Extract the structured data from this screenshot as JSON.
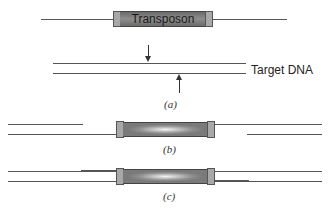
{
  "panel_a": {
    "transposon_label": "Transposon",
    "target_label": "Target DNA",
    "caption": "(a)"
  },
  "panel_b": {
    "caption": "(b)"
  },
  "panel_c": {
    "caption": "(c)"
  },
  "colors": {
    "line": "#555555",
    "cap": "#a8a8a8",
    "transposon_body": "#7a7a7a"
  }
}
